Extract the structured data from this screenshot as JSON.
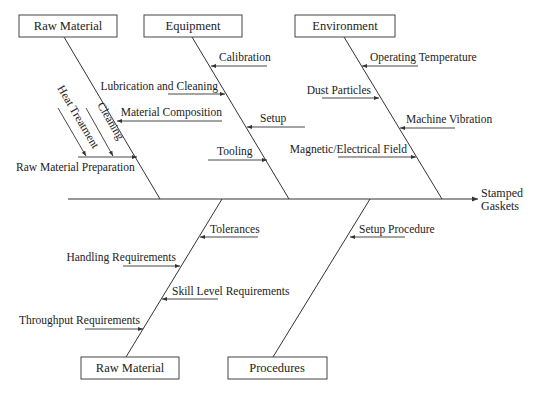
{
  "diagram": {
    "type": "fishbone",
    "effect": {
      "line1": "Stamped",
      "line2": "Gaskets"
    },
    "colors": {
      "line": "#333333",
      "text": "#222222",
      "box_border": "#444444",
      "background": "#ffffff"
    },
    "categories": {
      "top": [
        {
          "label": "Raw Material",
          "causes": [
            {
              "label": "Material Composition",
              "side": "right"
            },
            {
              "label": "Raw Material Preparation",
              "side": "left",
              "sub_causes": [
                {
                  "label": "Heat Treatment"
                },
                {
                  "label": "Cleaning"
                }
              ]
            }
          ]
        },
        {
          "label": "Equipment",
          "causes": [
            {
              "label": "Calibration",
              "side": "right"
            },
            {
              "label": "Lubrication and Cleaning",
              "side": "left"
            },
            {
              "label": "Setup",
              "side": "right"
            },
            {
              "label": "Tooling",
              "side": "left"
            }
          ]
        },
        {
          "label": "Environment",
          "causes": [
            {
              "label": "Operating Temperature",
              "side": "right"
            },
            {
              "label": "Dust Particles",
              "side": "left"
            },
            {
              "label": "Machine Vibration",
              "side": "right"
            },
            {
              "label": "Magnetic/Electrical Field",
              "side": "left"
            }
          ]
        }
      ],
      "bottom": [
        {
          "label": "Raw Material",
          "causes": [
            {
              "label": "Tolerances",
              "side": "right"
            },
            {
              "label": "Handling Requirements",
              "side": "left"
            },
            {
              "label": "Skill Level Requirements",
              "side": "right"
            },
            {
              "label": "Throughput Requirements",
              "side": "left"
            }
          ]
        },
        {
          "label": "Procedures",
          "causes": [
            {
              "label": "Setup Procedure",
              "side": "right"
            }
          ]
        }
      ]
    }
  }
}
